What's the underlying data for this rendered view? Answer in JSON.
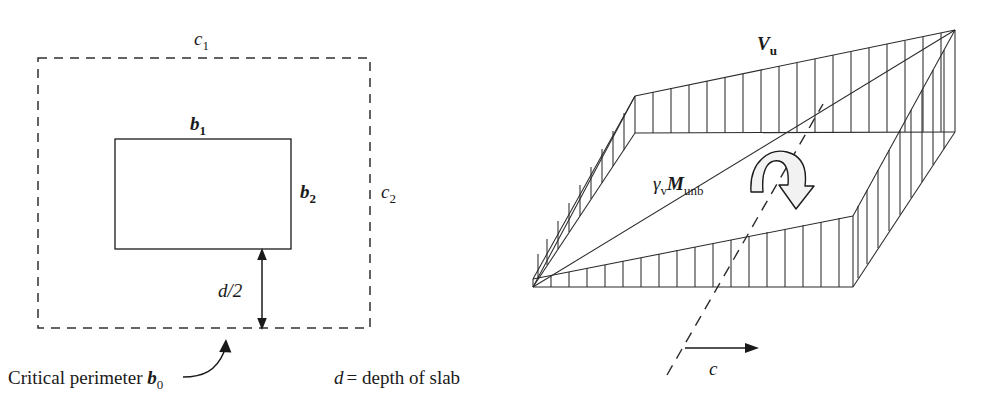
{
  "figure": {
    "title_left": "Critical perimeter plan view",
    "title_right": "Shear stress distribution on critical section"
  },
  "left_diagram": {
    "labels": {
      "c1_base": "c",
      "c1_sub": "1",
      "c2_base": "c",
      "c2_sub": "2",
      "b1_base": "b",
      "b1_sub": "1",
      "b2_base": "b",
      "b2_sub": "2",
      "d_over_2": "d/2",
      "critical_perimeter_text": "Critical perimeter ",
      "critical_perimeter_symbol": "b",
      "critical_perimeter_sub": "0",
      "depth_note_symbol": "d",
      "depth_note_text": "= depth of slab"
    },
    "geometry": {
      "dashed_rect": {
        "x": 38,
        "y": 58,
        "width": 332,
        "height": 270
      },
      "solid_rect": {
        "x": 115,
        "y": 139,
        "width": 176,
        "height": 110
      },
      "dim_arrow": {
        "x": 262,
        "y_top": 250,
        "y_bottom": 328
      }
    }
  },
  "right_diagram": {
    "labels": {
      "Vu_base": "V",
      "Vu_sub": "u",
      "gamma_v": "γ",
      "gamma_v_sub": "v",
      "M_base": "M",
      "M_sub": "unb",
      "c_axis": "c"
    },
    "geometry": {
      "hatch_count_top": 18,
      "hatch_count_front": 16,
      "hatch_count_left": 9,
      "hatch_count_right": 11
    }
  },
  "colors": {
    "ink": "#1a1a1a",
    "line": "#2b2b2b",
    "background": "#ffffff",
    "moment_fill": "#f2f2f2"
  }
}
